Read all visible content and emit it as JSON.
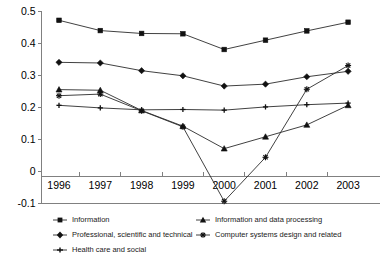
{
  "chart_data": {
    "type": "line",
    "title": "",
    "xlabel": "",
    "ylabel": "",
    "categories": [
      "1996",
      "1997",
      "1998",
      "1999",
      "2000",
      "2001",
      "2002",
      "2003"
    ],
    "ylim": [
      -0.1,
      0.5
    ],
    "yticks": [
      -0.1,
      0,
      0.1,
      0.2,
      0.3,
      0.4,
      0.5
    ],
    "ytick_labels": [
      "-0.1",
      "0",
      "0.1",
      "0.2",
      "0.3",
      "0.4",
      "0.5"
    ],
    "grid": false,
    "legend_position": "below",
    "series": [
      {
        "name": "Information",
        "marker": "square",
        "values": [
          0.471,
          0.439,
          0.43,
          0.429,
          0.38,
          0.409,
          0.438,
          0.465
        ]
      },
      {
        "name": "Professional, scientific and technical",
        "marker": "diamond",
        "values": [
          0.34,
          0.338,
          0.314,
          0.298,
          0.266,
          0.272,
          0.295,
          0.312
        ]
      },
      {
        "name": "Health care and social",
        "marker": "plus",
        "values": [
          0.206,
          0.198,
          0.192,
          0.193,
          0.191,
          0.201,
          0.208,
          0.213
        ]
      },
      {
        "name": "Information and data processing",
        "marker": "triangle",
        "values": [
          0.255,
          0.253,
          0.19,
          0.141,
          0.071,
          0.108,
          0.145,
          0.206
        ]
      },
      {
        "name": "Computer systems design and related",
        "marker": "star",
        "values": [
          0.236,
          0.241,
          0.189,
          0.139,
          -0.093,
          0.044,
          0.256,
          0.33
        ]
      }
    ]
  },
  "axes": {
    "y_axis_name": "value-axis",
    "x_axis_name": "year-axis"
  }
}
